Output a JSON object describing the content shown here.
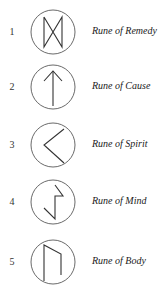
{
  "runes": [
    {
      "number": "1",
      "label": "Rune of Remedy",
      "icon": "dagaz-rune-icon"
    },
    {
      "number": "2",
      "label": "Rune of Cause",
      "icon": "tiwaz-arrow-up-rune-icon"
    },
    {
      "number": "3",
      "label": "Rune of Spirit",
      "icon": "kenaz-chevron-left-rune-icon"
    },
    {
      "number": "4",
      "label": "Rune of Mind",
      "icon": "sowilo-rune-icon"
    },
    {
      "number": "5",
      "label": "Rune of Body",
      "icon": "uruz-rune-icon"
    }
  ],
  "colors": {
    "stroke": "#333333",
    "background": "#ffffff"
  }
}
